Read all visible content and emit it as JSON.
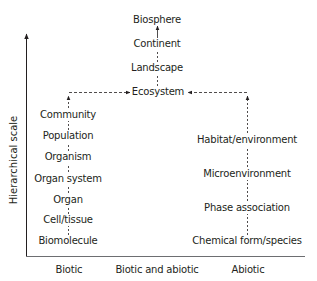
{
  "axes": {
    "y_label": "Hierarchical scale",
    "x_categories": [
      "Biotic",
      "Biotic and abiotic",
      "Abiotic"
    ]
  },
  "columns": {
    "biotic": [
      "Community",
      "Population",
      "Organism",
      "Organ system",
      "Organ",
      "Cell/tissue",
      "Biomolecule"
    ],
    "biotic_and_abiotic": [
      "Biosphere",
      "Continent",
      "Landscape",
      "Ecosystem"
    ],
    "abiotic": [
      "Habitat/environment",
      "Microenvironment",
      "Phase association",
      "Chemical form/species"
    ]
  },
  "colors": {
    "text": "#231f20",
    "lines": "#231f20",
    "axis": "#6d6e71"
  }
}
